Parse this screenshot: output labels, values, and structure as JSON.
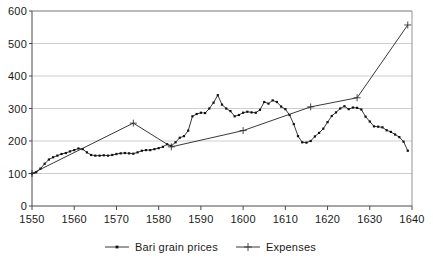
{
  "chart_data": {
    "type": "line",
    "title": "",
    "xlabel": "",
    "ylabel": "",
    "xlim": [
      1550,
      1640
    ],
    "ylim": [
      0,
      600
    ],
    "grid": true,
    "legend_position": "bottom",
    "x_ticks": [
      1550,
      1560,
      1570,
      1580,
      1590,
      1600,
      1610,
      1620,
      1630,
      1640
    ],
    "y_ticks": [
      0,
      100,
      200,
      300,
      400,
      500,
      600
    ],
    "series": [
      {
        "name": "Bari grain prices",
        "marker": "square-dot",
        "x": [
          1550,
          1551,
          1552,
          1553,
          1554,
          1555,
          1556,
          1557,
          1558,
          1559,
          1560,
          1561,
          1562,
          1563,
          1564,
          1565,
          1566,
          1567,
          1568,
          1569,
          1570,
          1571,
          1572,
          1573,
          1574,
          1575,
          1576,
          1577,
          1578,
          1579,
          1580,
          1581,
          1582,
          1583,
          1584,
          1585,
          1586,
          1587,
          1588,
          1589,
          1590,
          1591,
          1592,
          1593,
          1594,
          1595,
          1596,
          1597,
          1598,
          1599,
          1600,
          1601,
          1602,
          1603,
          1604,
          1605,
          1606,
          1607,
          1608,
          1609,
          1610,
          1611,
          1612,
          1613,
          1614,
          1615,
          1616,
          1617,
          1618,
          1619,
          1620,
          1621,
          1622,
          1623,
          1624,
          1625,
          1626,
          1627,
          1628,
          1629,
          1630,
          1631,
          1632,
          1633,
          1634,
          1635,
          1636,
          1637,
          1638,
          1639
        ],
        "values": [
          100,
          104,
          115,
          130,
          143,
          150,
          155,
          160,
          163,
          168,
          172,
          177,
          175,
          165,
          157,
          155,
          155,
          156,
          155,
          157,
          160,
          162,
          163,
          162,
          161,
          165,
          170,
          172,
          172,
          175,
          178,
          182,
          190,
          185,
          196,
          210,
          215,
          232,
          276,
          283,
          287,
          286,
          300,
          318,
          341,
          312,
          300,
          292,
          276,
          280,
          287,
          290,
          288,
          287,
          296,
          320,
          315,
          325,
          320,
          306,
          298,
          280,
          252,
          215,
          196,
          195,
          200,
          214,
          225,
          238,
          258,
          277,
          288,
          300,
          307,
          298,
          303,
          302,
          297,
          275,
          260,
          245,
          244,
          242,
          233,
          228,
          220,
          212,
          198,
          170
        ]
      },
      {
        "name": "Expenses",
        "marker": "plus",
        "x": [
          1550,
          1574,
          1583,
          1600,
          1616,
          1627,
          1639
        ],
        "values": [
          100,
          255,
          182,
          232,
          305,
          333,
          557
        ]
      }
    ]
  },
  "legend": {
    "items": [
      {
        "label": "Bari grain prices"
      },
      {
        "label": "Expenses"
      }
    ]
  },
  "axis": {
    "y_tick_labels": [
      "600",
      "500",
      "400",
      "300",
      "200",
      "100",
      "0"
    ],
    "x_tick_labels": [
      "1550",
      "1560",
      "1570",
      "1580",
      "1590",
      "1600",
      "1610",
      "1620",
      "1630",
      "1640"
    ]
  },
  "colors": {
    "series_line": "#222222",
    "gridline": "#b9b9b9",
    "axis": "#4a4a4a",
    "text": "#1a1a1a",
    "background": "#ffffff"
  }
}
